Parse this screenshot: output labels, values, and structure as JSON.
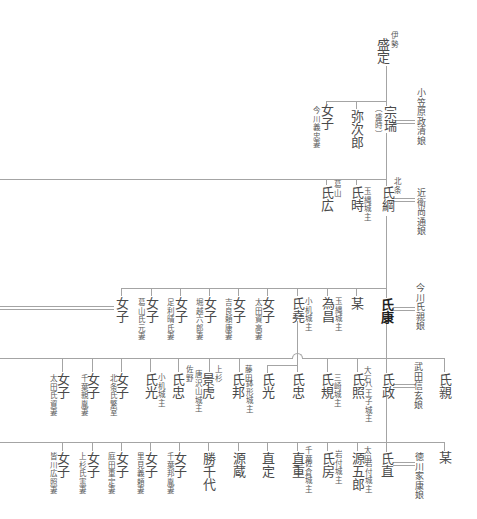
{
  "colors": {
    "text": "#4a4a4a",
    "line": "#a4a4a4",
    "highlight": "#1e1e1e"
  },
  "tree": {
    "g1": {
      "main": {
        "name": "盛定",
        "prefix": "伊勢"
      }
    },
    "g2": {
      "main": {
        "name": "宗瑞",
        "alias": "（盛時）"
      },
      "spouse": "小笠原政清娘",
      "siblings": [
        {
          "name": "弥次郎"
        },
        {
          "name": "女子",
          "note": "今川義忠妻"
        }
      ]
    },
    "g3": {
      "main": {
        "name": "氏綱",
        "prefix": "北条"
      },
      "spouse": "近衛尚通娘",
      "siblings": [
        {
          "name": "氏時",
          "note": "玉縄城主"
        },
        {
          "name": "氏広",
          "prefix": "葛山"
        }
      ]
    },
    "g4": {
      "main": {
        "name": "氏康"
      },
      "spouse": "今川氏親娘",
      "siblings": [
        {
          "name": "某"
        },
        {
          "name": "為昌",
          "note": "玉縄城主"
        },
        {
          "name": "氏堯",
          "note": "小机城主"
        },
        {
          "name": "女子",
          "note": "太田資高妻"
        },
        {
          "name": "女子",
          "note": "吉良頼康妻"
        },
        {
          "name": "女子",
          "note": "堀越六郎妻"
        },
        {
          "name": "女子",
          "note": "足利晴氏妻"
        },
        {
          "name": "女子",
          "note": "葛山氏元妻"
        },
        {
          "name": "女子"
        }
      ]
    },
    "g5": {
      "main": {
        "name": "氏政"
      },
      "spouse": "武田信玄娘",
      "siblings": [
        {
          "name": "氏親"
        },
        {
          "name": "氏照",
          "prefix": "大石",
          "note": "八王子城主"
        },
        {
          "name": "氏規",
          "note": "三崎城主"
        },
        {
          "name": "氏邦",
          "prefix": "藤田",
          "note": "鉢形城主"
        },
        {
          "name": "景虎",
          "prefix": "上杉"
        },
        {
          "name": "氏忠",
          "prefix": "佐野",
          "note": "唐沢山城主"
        },
        {
          "name": "氏光",
          "note": "小机城主"
        },
        {
          "name": "女子",
          "note": "北条氏繁室"
        },
        {
          "name": "女子",
          "note": "千葉親胤妻"
        },
        {
          "name": "女子",
          "note": "太田氏資妻"
        }
      ],
      "ujitaka_children": [
        {
          "name": "氏忠"
        },
        {
          "name": "氏光"
        }
      ]
    },
    "g6": {
      "main": {
        "name": "氏直"
      },
      "spouse": "徳川家康娘",
      "siblings": [
        {
          "name": "某"
        },
        {
          "name": "源五郎",
          "prefix": "太田",
          "note": "岩付城主"
        },
        {
          "name": "氏房",
          "note": "岩付城主"
        },
        {
          "name": "直重",
          "prefix": "千葉",
          "note": "佐倉城主"
        },
        {
          "name": "直定"
        },
        {
          "name": "源蔵"
        },
        {
          "name": "勝千代"
        },
        {
          "name": "女子",
          "note": "千葉邦胤妻"
        },
        {
          "name": "女子",
          "note": "里見義頼妻"
        },
        {
          "name": "女子",
          "note": "庭田重定妻"
        },
        {
          "name": "女子",
          "note": "上杉氏憲妻"
        },
        {
          "name": "女子",
          "note": "皆川広照妻"
        }
      ]
    }
  }
}
